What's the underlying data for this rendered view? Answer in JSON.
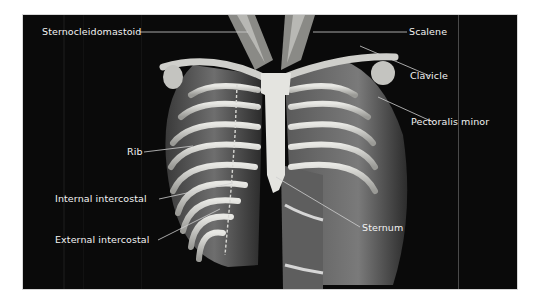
{
  "figure": {
    "background_color": "#0a0a0a",
    "label_color": "#f2f2f2",
    "leader_line_color": "#cfcfcf"
  },
  "labels": {
    "left": [
      {
        "id": "sternocleidomastoid",
        "text": "Sternocleidomastoid"
      },
      {
        "id": "rib",
        "text": "Rib"
      },
      {
        "id": "internal_intercostal",
        "text": "Internal intercostal"
      },
      {
        "id": "external_intercostal",
        "text": "External intercostal"
      }
    ],
    "right": [
      {
        "id": "scalene",
        "text": "Scalene"
      },
      {
        "id": "clavicle",
        "text": "Clavicle"
      },
      {
        "id": "pectoralis_minor",
        "text": "Pectoralis minor"
      },
      {
        "id": "sternum",
        "text": "Sternum"
      }
    ]
  }
}
